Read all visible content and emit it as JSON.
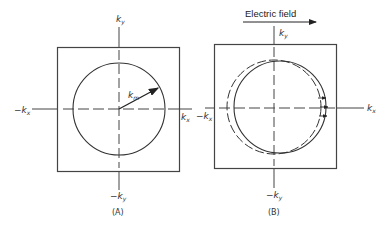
{
  "figure": {
    "panels": [
      {
        "id": "A",
        "caption": "(A)",
        "axis_labels": {
          "kx_pos": "k",
          "kx_pos_sub": "x",
          "kx_neg": "−k",
          "kx_neg_sub": "x",
          "ky_pos": "k",
          "ky_pos_sub": "y",
          "ky_neg": "−k",
          "ky_neg_sub": "y"
        },
        "vector_label": "k",
        "vector_label_sub": "m",
        "description": "Fermi circle centered at origin with radius vector k_m"
      },
      {
        "id": "B",
        "caption": "(B)",
        "title": "Electric field",
        "axis_labels": {
          "kx_pos": "k",
          "kx_pos_sub": "x",
          "kx_neg": "−k",
          "kx_neg_sub": "x",
          "ky_pos": "k",
          "ky_pos_sub": "y",
          "ky_neg": "−k",
          "ky_neg_sub": "y"
        },
        "description": "Solid circle displaced in +kx relative to dashed equilibrium circle under electric field"
      }
    ],
    "colors": {
      "line": "#333333",
      "background": "#ffffff"
    }
  }
}
